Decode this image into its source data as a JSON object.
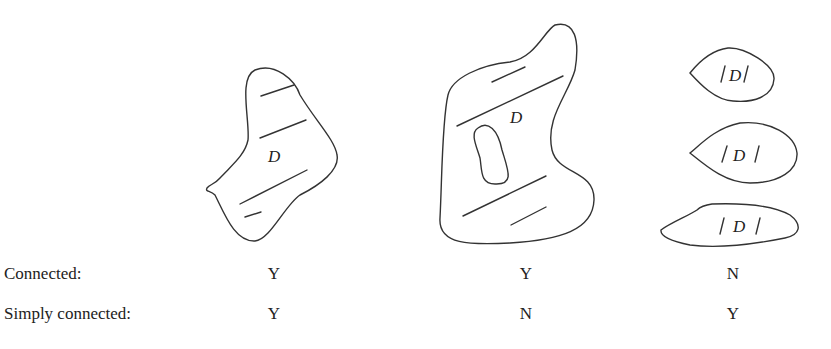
{
  "figures": [
    {
      "id": "region-1",
      "label": "D",
      "description": "connected, simply connected region"
    },
    {
      "id": "region-2",
      "label": "D",
      "description": "connected region with a hole"
    },
    {
      "id": "region-3",
      "labels": [
        "|D|",
        "|D|",
        "|D|"
      ],
      "description": "three disjoint regions"
    }
  ],
  "table": {
    "rows": [
      {
        "label": "Connected:",
        "values": [
          "Y",
          "Y",
          "N"
        ]
      },
      {
        "label": "Simply connected:",
        "values": [
          "Y",
          "N",
          "Y"
        ]
      }
    ]
  }
}
